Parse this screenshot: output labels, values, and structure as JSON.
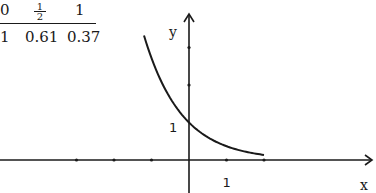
{
  "table": {
    "x_values": [
      {
        "label": "0"
      },
      {
        "label": "1/2",
        "num": "1",
        "den": "2"
      },
      {
        "label": "1"
      }
    ],
    "y_values": [
      "1",
      "0.61",
      "0.37"
    ]
  },
  "chart_data": {
    "type": "line",
    "title": "",
    "function": "y = e^(-x)",
    "xlabel": "x",
    "ylabel": "y",
    "xlim": [
      -5.1,
      5.0
    ],
    "ylim": [
      -0.9,
      3.9
    ],
    "x_ticks": [
      -3,
      -2,
      -1,
      1,
      2
    ],
    "y_ticks": [
      2,
      3
    ],
    "tick_labels": {
      "x": [
        "1"
      ],
      "y": [
        "1"
      ]
    },
    "x_tick_label_values": [
      1
    ],
    "y_tick_label_values": [
      1
    ],
    "series": [
      {
        "name": "e^(-x)",
        "x_range": [
          -1.2,
          2.0
        ],
        "points": [
          [
            -1.2,
            3.32
          ],
          [
            -1,
            2.72
          ],
          [
            -0.5,
            1.65
          ],
          [
            0,
            1
          ],
          [
            0.5,
            0.61
          ],
          [
            1,
            0.37
          ],
          [
            1.5,
            0.22
          ],
          [
            2,
            0.14
          ]
        ]
      }
    ],
    "grid": false,
    "legend": "none"
  }
}
